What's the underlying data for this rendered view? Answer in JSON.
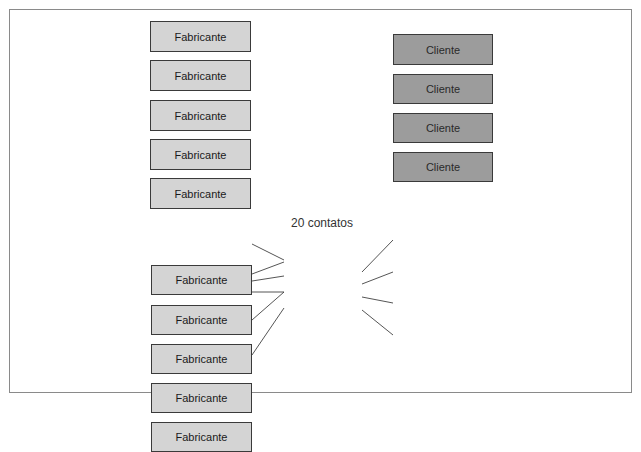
{
  "diagram": {
    "top": {
      "manufacturers": [
        "Fabricante",
        "Fabricante",
        "Fabricante",
        "Fabricante",
        "Fabricante"
      ],
      "clients": [
        "Cliente",
        "Cliente",
        "Cliente",
        "Cliente"
      ],
      "caption": "20 contatos"
    },
    "bottom": {
      "manufacturers": [
        "Fabricante",
        "Fabricante",
        "Fabricante",
        "Fabricante",
        "Fabricante"
      ],
      "hub_line1": "Atacadista",
      "hub_line2": "intermediário",
      "clients": [
        "Cliente",
        "Cliente",
        "Cliente",
        "Cliente"
      ],
      "caption": "9 contatos"
    },
    "colors": {
      "manufacturer_fill": "#d4d4d4",
      "client_fill": "#9c9c9c",
      "hub_fill": "#6e6e6e",
      "border": "#3a3a3a"
    }
  }
}
